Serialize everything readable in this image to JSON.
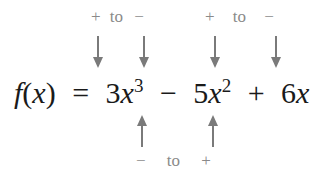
{
  "top_labels": [
    {
      "from": "+",
      "to_word": "to",
      "to": "−"
    },
    {
      "from": "+",
      "to_word": "to",
      "to": "−"
    }
  ],
  "bottom_label": {
    "from": "−",
    "to_word": "to",
    "to": "+"
  },
  "equation": {
    "lhs_f": "f",
    "lhs_open": "(",
    "lhs_x": "x",
    "lhs_close": ")",
    "equals": "=",
    "t1_coef": "3",
    "t1_var": "x",
    "t1_exp": "3",
    "op1": "−",
    "t2_coef": "5",
    "t2_var": "x",
    "t2_exp": "2",
    "op2": "+",
    "t3_coef": "6",
    "t3_var": "x",
    "op3": "−",
    "t4": "4"
  }
}
